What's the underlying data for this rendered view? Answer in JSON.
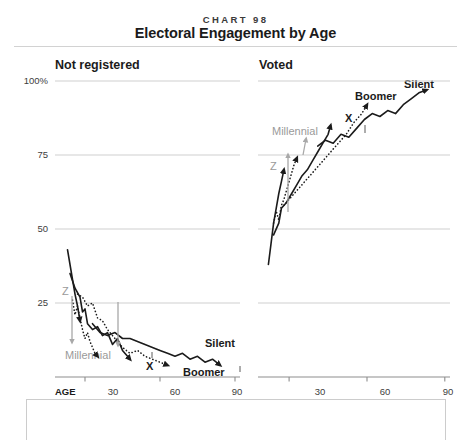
{
  "header": {
    "kicker": "CHART 98",
    "title": "Electoral Engagement by Age"
  },
  "panels": {
    "left": {
      "heading": "Not registered"
    },
    "right": {
      "heading": "Voted"
    }
  },
  "axes": {
    "y_labels": [
      "100%",
      "75",
      "50",
      "25"
    ],
    "y_values": [
      100,
      75,
      50,
      25
    ],
    "x_axis_name": "AGE",
    "x_labels_left": [
      "30",
      "60",
      "90"
    ],
    "x_labels_right": [
      "30",
      "60",
      "90"
    ],
    "x_values": [
      30,
      60,
      90
    ]
  },
  "annotations": {
    "left": {
      "z": "Z",
      "millennial": "Millennial",
      "x": "X",
      "boomer": "Boomer",
      "silent": "Silent"
    },
    "right": {
      "z": "Z",
      "millennial": "Millennial",
      "x": "X",
      "boomer": "Boomer",
      "silent": "Silent"
    }
  },
  "colors": {
    "line": "#1b1b1b",
    "gridline": "#cfcfcf",
    "axis": "#9a9a9a",
    "annotation_gray": "#9a9a9a",
    "text": "#231f20",
    "background": "#ffffff"
  },
  "chart_data": {
    "type": "line",
    "title": "Electoral Engagement by Age",
    "subtitle": "CHART 98",
    "xlabel": "AGE",
    "ylabel": "Percent",
    "ylim": [
      0,
      100
    ],
    "xlim": [
      18,
      92
    ],
    "grid": true,
    "legend": "inline-annotations",
    "panels": [
      {
        "name": "Not registered",
        "ylim": [
          0,
          100
        ],
        "yticks": [
          25,
          50,
          75,
          100
        ],
        "xticks": [
          30,
          60,
          90
        ],
        "series": [
          {
            "name": "Z",
            "style": "solid",
            "arrow_end": true,
            "points": [
              [
                23,
                43
              ],
              [
                24,
                38
              ],
              [
                25,
                33
              ],
              [
                26,
                28
              ],
              [
                27,
                24
              ],
              [
                28,
                19
              ]
            ]
          },
          {
            "name": "Millennial",
            "style": "dotted",
            "arrow_end": true,
            "points": [
              [
                25,
                26
              ],
              [
                26,
                21
              ],
              [
                27,
                24
              ],
              [
                28,
                20
              ],
              [
                29,
                16
              ],
              [
                30,
                13
              ],
              [
                31,
                15
              ],
              [
                32,
                12
              ],
              [
                33,
                10
              ],
              [
                34,
                8
              ],
              [
                35,
                7
              ]
            ]
          },
          {
            "name": "X",
            "style": "solid",
            "arrow_end": true,
            "points": [
              [
                24,
                35
              ],
              [
                26,
                30
              ],
              [
                28,
                27
              ],
              [
                29,
                22
              ],
              [
                30,
                23
              ],
              [
                31,
                18
              ],
              [
                33,
                16
              ],
              [
                35,
                17
              ],
              [
                37,
                14
              ],
              [
                39,
                15
              ],
              [
                41,
                11
              ],
              [
                43,
                13
              ],
              [
                45,
                9
              ],
              [
                47,
                7
              ],
              [
                48,
                6
              ]
            ]
          },
          {
            "name": "Boomer",
            "style": "dotted",
            "arrow_end": true,
            "points": [
              [
                27,
                28
              ],
              [
                29,
                27
              ],
              [
                31,
                24
              ],
              [
                33,
                25
              ],
              [
                35,
                20
              ],
              [
                37,
                19
              ],
              [
                39,
                16
              ],
              [
                41,
                14
              ],
              [
                43,
                12
              ],
              [
                45,
                10
              ],
              [
                48,
                8
              ],
              [
                51,
                9
              ],
              [
                54,
                7
              ],
              [
                57,
                6
              ],
              [
                60,
                5
              ],
              [
                63,
                4
              ]
            ]
          },
          {
            "name": "Silent",
            "style": "solid",
            "arrow_end": true,
            "points": [
              [
                33,
                18
              ],
              [
                36,
                15
              ],
              [
                39,
                14
              ],
              [
                42,
                15
              ],
              [
                45,
                13
              ],
              [
                48,
                13
              ],
              [
                51,
                12
              ],
              [
                54,
                11
              ],
              [
                57,
                10
              ],
              [
                60,
                9
              ],
              [
                63,
                8
              ],
              [
                66,
                7
              ],
              [
                69,
                8
              ],
              [
                72,
                6
              ],
              [
                75,
                7
              ],
              [
                78,
                5
              ],
              [
                81,
                6
              ],
              [
                84,
                4
              ]
            ]
          }
        ]
      },
      {
        "name": "Voted",
        "ylim": [
          0,
          100
        ],
        "yticks": [
          25,
          50,
          75,
          100
        ],
        "xticks": [
          30,
          60,
          90
        ],
        "series": [
          {
            "name": "Z",
            "style": "solid",
            "arrow_end": true,
            "points": [
              [
                22,
                38
              ],
              [
                23,
                45
              ],
              [
                24,
                52
              ],
              [
                25,
                57
              ],
              [
                26,
                62
              ],
              [
                27,
                66
              ],
              [
                28,
                70
              ]
            ]
          },
          {
            "name": "Millennial",
            "style": "dotted",
            "arrow_end": true,
            "points": [
              [
                24,
                52
              ],
              [
                25,
                56
              ],
              [
                26,
                53
              ],
              [
                27,
                58
              ],
              [
                28,
                60
              ],
              [
                29,
                63
              ],
              [
                30,
                66
              ],
              [
                31,
                69
              ],
              [
                32,
                72
              ],
              [
                33,
                74
              ]
            ]
          },
          {
            "name": "X",
            "style": "solid",
            "arrow_end": true,
            "points": [
              [
                24,
                48
              ],
              [
                26,
                52
              ],
              [
                27,
                57
              ],
              [
                29,
                59
              ],
              [
                31,
                62
              ],
              [
                33,
                65
              ],
              [
                35,
                68
              ],
              [
                37,
                70
              ],
              [
                39,
                73
              ],
              [
                41,
                76
              ],
              [
                43,
                79
              ],
              [
                45,
                82
              ],
              [
                46,
                85
              ]
            ]
          },
          {
            "name": "Boomer",
            "style": "dotted",
            "arrow_end": true,
            "points": [
              [
                28,
                58
              ],
              [
                31,
                61
              ],
              [
                34,
                64
              ],
              [
                37,
                67
              ],
              [
                40,
                70
              ],
              [
                43,
                73
              ],
              [
                46,
                76
              ],
              [
                49,
                79
              ],
              [
                52,
                82
              ],
              [
                55,
                86
              ],
              [
                58,
                89
              ],
              [
                60,
                92
              ]
            ]
          },
          {
            "name": "Silent",
            "style": "solid",
            "arrow_end": true,
            "points": [
              [
                41,
                78
              ],
              [
                44,
                80
              ],
              [
                47,
                79
              ],
              [
                50,
                82
              ],
              [
                53,
                81
              ],
              [
                56,
                84
              ],
              [
                59,
                87
              ],
              [
                62,
                89
              ],
              [
                65,
                88
              ],
              [
                68,
                90
              ],
              [
                71,
                89
              ],
              [
                74,
                92
              ],
              [
                77,
                94
              ],
              [
                80,
                96
              ],
              [
                83,
                97
              ]
            ]
          }
        ]
      }
    ]
  }
}
